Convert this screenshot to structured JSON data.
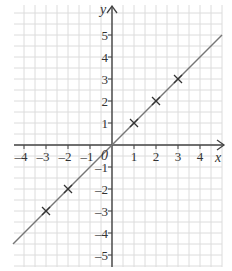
{
  "chart_data": {
    "type": "line",
    "title": "",
    "xlabel": "x",
    "ylabel": "y",
    "origin_label": "0",
    "xlim": [
      -4.5,
      5.3
    ],
    "ylim": [
      -5.5,
      5.8
    ],
    "grid": true,
    "grid_minor_step": 0.5,
    "x_ticks": [
      -4,
      -3,
      -2,
      -1,
      1,
      2,
      3,
      4
    ],
    "x_tick_labels": [
      "–4",
      "–3",
      "–2",
      "–1",
      "1",
      "2",
      "3",
      "4"
    ],
    "y_ticks": [
      5,
      4,
      3,
      2,
      1,
      -1,
      -2,
      -3,
      -4,
      -5
    ],
    "y_tick_labels": [
      "5",
      "4",
      "3",
      "2",
      "1",
      "–1",
      "–2",
      "–3",
      "–4",
      "–5"
    ],
    "series": [
      {
        "name": "y = x",
        "kind": "line",
        "x": [
          -4.5,
          5
        ],
        "y": [
          -4.5,
          5
        ],
        "color": "#777777"
      },
      {
        "name": "plotted points",
        "kind": "scatter",
        "marker": "x",
        "x": [
          -3,
          -2,
          1,
          2,
          3
        ],
        "y": [
          -3,
          -2,
          1,
          2,
          3
        ],
        "color": "#333333"
      }
    ],
    "legend": null
  },
  "colors": {
    "grid": "#dcdcdc",
    "axis": "#444444",
    "line": "#777777",
    "marker": "#333333"
  }
}
